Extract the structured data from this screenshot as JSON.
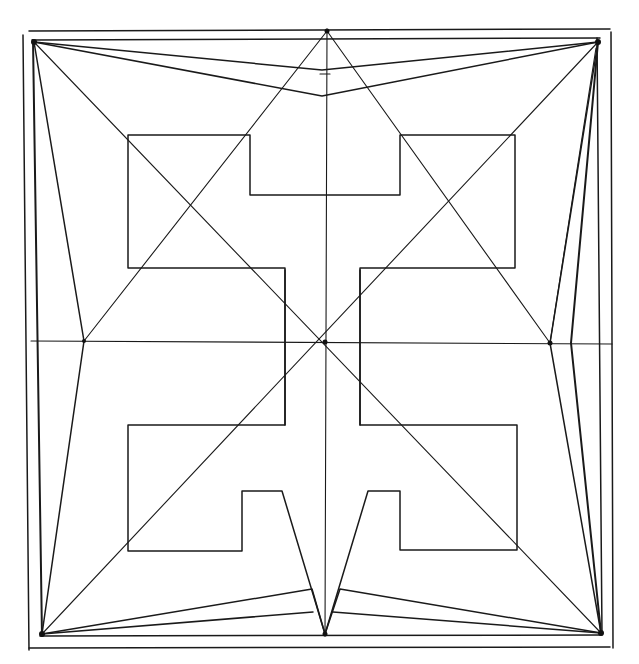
{
  "diagram": {
    "title": "",
    "colors": {
      "background": "#ffffff",
      "ink": "#1a1a1a"
    },
    "frames": {
      "outer": {
        "x1": 28,
        "y1": 30,
        "x2": 610,
        "y2": 648
      },
      "inner": {
        "x1": 34,
        "y1": 40,
        "x2": 598,
        "y2": 637
      }
    },
    "center": {
      "x": 325,
      "y": 342
    },
    "corners": {
      "tl": {
        "x": 34,
        "y": 42
      },
      "tr": {
        "x": 598,
        "y": 42
      },
      "bl": {
        "x": 42,
        "y": 634
      },
      "br": {
        "x": 601,
        "y": 633
      },
      "top_mid": {
        "x": 327,
        "y": 31
      },
      "bottom_mid": {
        "x": 325,
        "y": 634
      },
      "left_mid": {
        "x": 84,
        "y": 341
      },
      "right_mid": {
        "x": 550,
        "y": 343
      }
    },
    "annotations": []
  }
}
